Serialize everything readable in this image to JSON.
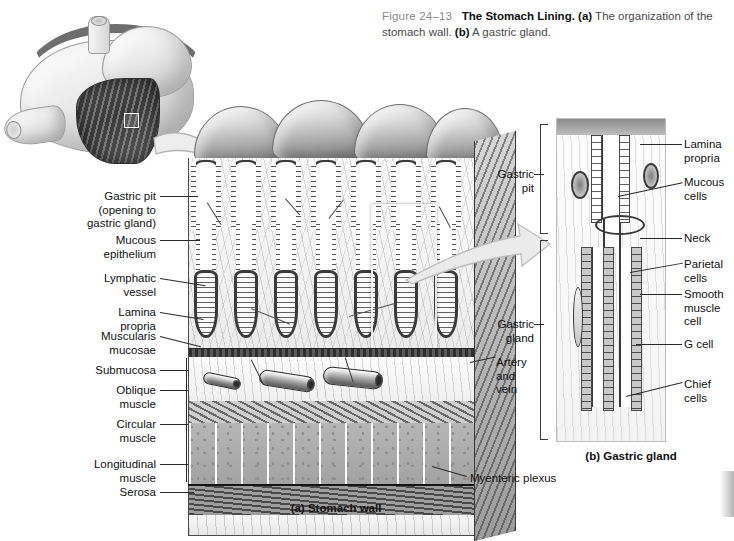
{
  "caption": {
    "figure_number": "Figure 24–13",
    "title": "The Stomach Lining.",
    "part_a_marker": "(a)",
    "part_a_text": " The organization of the stomach wall. ",
    "part_b_marker": "(b)",
    "part_b_text": " A gastric gland."
  },
  "panel_a": {
    "caption": "(a) Stomach wall",
    "labels_left": [
      {
        "id": "gastric-pit",
        "text": "Gastric pit\n(opening to\ngastric gland)"
      },
      {
        "id": "mucous-epithelium",
        "text": "Mucous\nepithelium"
      },
      {
        "id": "lymphatic-vessel",
        "text": "Lymphatic\nvessel"
      },
      {
        "id": "lamina-propria",
        "text": "Lamina\npropria"
      },
      {
        "id": "muscularis-mucosae",
        "text": "Muscularis\nmucosae"
      },
      {
        "id": "submucosa",
        "text": "Submucosa"
      },
      {
        "id": "oblique-muscle",
        "text": "Oblique\nmuscle"
      },
      {
        "id": "circular-muscle",
        "text": "Circular\nmuscle"
      },
      {
        "id": "longitudinal-muscle",
        "text": "Longitudinal\nmuscle"
      },
      {
        "id": "serosa",
        "text": "Serosa"
      }
    ],
    "labels_right": [
      {
        "id": "artery-and-vein",
        "text": "Artery\nand\nvein"
      },
      {
        "id": "myenteric-plexus",
        "text": "Myenteric plexus"
      }
    ]
  },
  "panel_b": {
    "caption": "(b) Gastric gland",
    "brackets_left": [
      {
        "id": "gastric-pit",
        "text": "Gastric\npit"
      },
      {
        "id": "gastric-gland",
        "text": "Gastric\ngland"
      }
    ],
    "labels_right": [
      {
        "id": "lamina-propria",
        "text": "Lamina\npropria"
      },
      {
        "id": "mucous-cells",
        "text": "Mucous\ncells"
      },
      {
        "id": "neck",
        "text": "Neck"
      },
      {
        "id": "parietal-cells",
        "text": "Parietal\ncells"
      },
      {
        "id": "smooth-muscle-cell",
        "text": "Smooth\nmuscle\ncell"
      },
      {
        "id": "g-cell",
        "text": "G cell"
      },
      {
        "id": "chief-cells",
        "text": "Chief\ncells"
      }
    ]
  },
  "inset": {
    "name": "stomach-cutaway-illustration",
    "region_marker": "highlight-box"
  },
  "colors": {
    "background": "#ffffff",
    "text": "#111111",
    "caption_gray": "#8a8a8a",
    "line": "#2a2a2a",
    "arrow_fill": "#e9e9e9",
    "arrow_stroke": "#b5b5b5"
  }
}
